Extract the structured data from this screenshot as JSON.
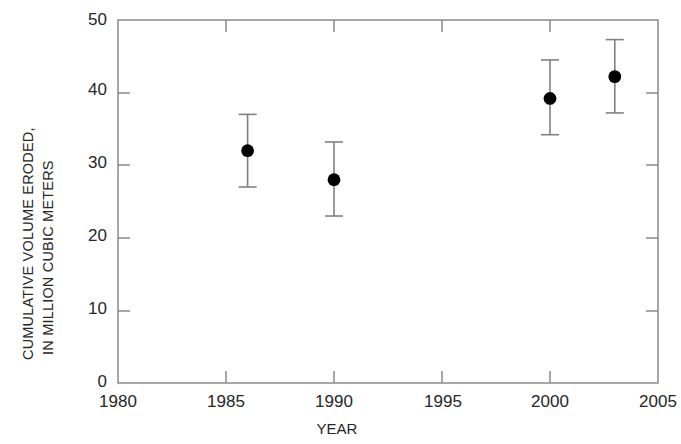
{
  "chart_data": {
    "type": "scatter",
    "title": "",
    "xlabel": "YEAR",
    "ylabel": "CUMULATIVE VOLUME ERODED, IN MILLION CUBIC METERS",
    "ylabel_line1": "CUMULATIVE VOLUME ERODED,",
    "ylabel_line2": "IN MILLION CUBIC METERS",
    "xlim": [
      1980,
      2005
    ],
    "ylim": [
      0,
      50
    ],
    "xticks": [
      1980,
      1985,
      1990,
      1995,
      2000,
      2005
    ],
    "xtick_labels": [
      "1980",
      "1985",
      "1990",
      "1995",
      "2000",
      "2005"
    ],
    "yticks": [
      0,
      10,
      20,
      30,
      40,
      50
    ],
    "ytick_labels": [
      "0",
      "10",
      "20",
      "30",
      "40",
      "50"
    ],
    "grid": false,
    "legend": null,
    "error_bars": true,
    "x": [
      1986,
      1990,
      2000,
      2003
    ],
    "values": [
      32,
      28,
      39.2,
      42.2
    ],
    "yerr_low": [
      27,
      23,
      34.2,
      37.2
    ],
    "yerr_high": [
      37,
      33.2,
      44.5,
      47.3
    ],
    "points": [
      {
        "year": 1986,
        "value": 32,
        "low": 27,
        "high": 37
      },
      {
        "year": 1990,
        "value": 28,
        "low": 23,
        "high": 33.2
      },
      {
        "year": 2000,
        "value": 39.2,
        "low": 34.2,
        "high": 44.5
      },
      {
        "year": 2003,
        "value": 42.2,
        "low": 37.2,
        "high": 47.3
      }
    ],
    "marker_color": "#000000",
    "axis_color": "#808080",
    "text_color": "#262626"
  }
}
